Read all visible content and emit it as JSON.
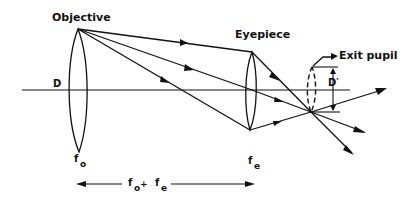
{
  "diagram": {
    "labels": {
      "objective": "Objective",
      "eyepiece": "Eyepiece",
      "exit_pupil": "Exit pupil",
      "diameter_objective": "D",
      "diameter_exit": "D′",
      "f_objective": "f",
      "f_objective_sub": "o",
      "f_eyepiece": "f",
      "f_eyepiece_sub": "e",
      "length_f": "f",
      "length_o": "o",
      "length_plus": " + ",
      "length_f2": "f",
      "length_e": "e"
    },
    "colors": {
      "ink": "#111111",
      "background": "#ffffff"
    }
  }
}
